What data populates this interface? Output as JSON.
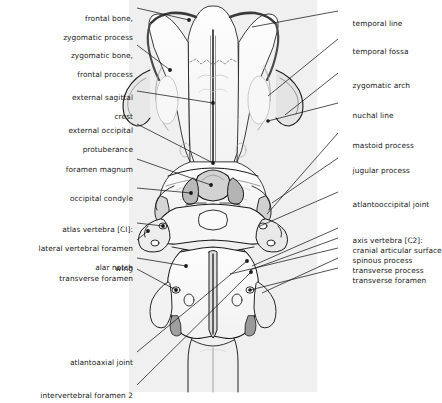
{
  "figure": {
    "panel_color": "#f0f0f0",
    "line_color": "#1a1a1a",
    "shade_color": "#8a8a8a",
    "text_color": "#1a1a1a"
  },
  "labels_left": [
    {
      "id": "frontal-bone-zygomatic-process",
      "line1": "frontal bone,",
      "line2": "zygomatic process",
      "x": 133,
      "y": 8
    },
    {
      "id": "zygomatic-bone-frontal-process",
      "line1": "zygomatic bone,",
      "line2": "frontal process",
      "x": 133,
      "y": 45
    },
    {
      "id": "external-sagittal-crest",
      "line1": "external sagittal",
      "line2": "crest",
      "x": 133,
      "y": 83
    },
    {
      "id": "external-occipital-protuberance",
      "line1": "external occipital",
      "line2": "protuberance",
      "x": 133,
      "y": 120
    },
    {
      "id": "foramen-magnum",
      "line1": "foramen magnum",
      "line2": "",
      "x": 133,
      "y": 159
    },
    {
      "id": "occipital-condyle",
      "line1": "occipital condyle",
      "line2": "",
      "x": 133,
      "y": 188
    },
    {
      "id": "atlas-vertebra-c1",
      "line1": "atlas vertebra [CI]:",
      "line2": "lateral vertebral foramen",
      "line3": "alar notch",
      "x": 133,
      "y": 219
    },
    {
      "id": "wing",
      "line1": "wing",
      "line2": "",
      "x": 133,
      "y": 258
    },
    {
      "id": "transverse-foramen-c1",
      "line1": "transverse foramen",
      "line2": "",
      "x": 133,
      "y": 268
    },
    {
      "id": "atlantoaxial-joint",
      "line1": "atlantoaxial joint",
      "line2": "",
      "x": 133,
      "y": 352
    },
    {
      "id": "intervertebral-foramen-2",
      "line1": "intervertebral foramen 2",
      "line2": "",
      "x": 133,
      "y": 385
    }
  ],
  "labels_right": [
    {
      "id": "temporal-line",
      "line1": "temporal line",
      "x": 343,
      "y": 13
    },
    {
      "id": "temporal-fossa",
      "line1": "temporal fossa",
      "x": 343,
      "y": 41
    },
    {
      "id": "zygomatic-arch",
      "line1": "zygomatic arch",
      "x": 343,
      "y": 75
    },
    {
      "id": "nuchal-line",
      "line1": "nuchal line",
      "x": 343,
      "y": 105
    },
    {
      "id": "mastoid-process",
      "line1": "mastoid process",
      "x": 343,
      "y": 135
    },
    {
      "id": "jugular-process",
      "line1": "jugular process",
      "x": 343,
      "y": 160
    },
    {
      "id": "atlantooccipital-joint",
      "line1": "atlantooccipital joint",
      "x": 343,
      "y": 194
    },
    {
      "id": "axis-vertebra-c2",
      "line1": "axis vertebra [C2]:",
      "x": 343,
      "y": 230
    },
    {
      "id": "cranial-articular-surface",
      "line1": "cranial articular surface",
      "x": 343,
      "y": 240
    },
    {
      "id": "spinous-process",
      "line1": "spinous process",
      "x": 343,
      "y": 250
    },
    {
      "id": "transverse-process",
      "line1": "transverse process",
      "x": 343,
      "y": 260
    },
    {
      "id": "transverse-foramen-c2",
      "line1": "transverse foramen",
      "x": 343,
      "y": 270
    }
  ]
}
